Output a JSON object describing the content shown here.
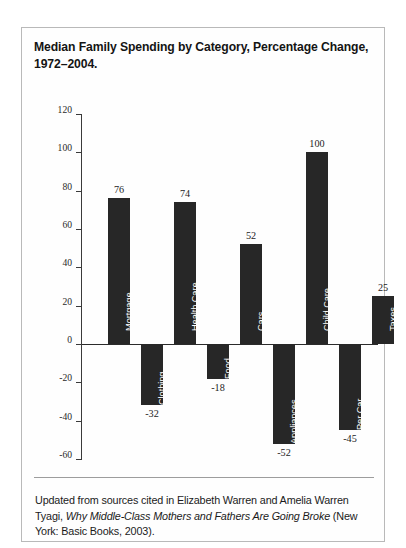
{
  "figure": {
    "title_line_1": "Median Family Spending by Category, Percentage Change,",
    "title_line_2": "1972–2004.",
    "footnote_part_1": "Updated from sources cited in Elizabeth Warren and Amelia Warren Tyagi, ",
    "footnote_italic": "Why Middle-Class Mothers and Fathers Are Going Broke",
    "footnote_part_2": " (New York: Basic Books, 2003)."
  },
  "chart_data": {
    "type": "bar",
    "title": "Median Family Spending by Category, Percentage Change, 1972–2004.",
    "xlabel": "",
    "ylabel": "",
    "ylim": [
      -60,
      120
    ],
    "yticks": [
      120,
      100,
      80,
      60,
      40,
      20,
      0,
      -20,
      -40,
      -60
    ],
    "ytick_labels": [
      "120",
      "100",
      "80",
      "60",
      "40",
      "20",
      "0",
      "-20",
      "-40",
      "-60"
    ],
    "grid": false,
    "legend": "none",
    "bar_color": "#272727",
    "categories": [
      "Mortgage",
      "Clothing",
      "Health Care",
      "Food",
      "Cars",
      "Appliances",
      "Child Care",
      "Per Car",
      "Taxes"
    ],
    "values": [
      76,
      -32,
      74,
      -18,
      52,
      -52,
      100,
      -45,
      25
    ],
    "value_labels": [
      "76",
      "-32",
      "74",
      "-18",
      "52",
      "-52",
      "100",
      "-45",
      "25"
    ]
  }
}
